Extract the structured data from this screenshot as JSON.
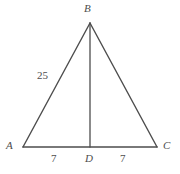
{
  "figure": {
    "stroke_color": "#4d4d4d",
    "background_color": "#ffffff",
    "text_color": "#4d4d4d"
  },
  "vertices": {
    "b": {
      "label": "B",
      "x": 90,
      "y": 23
    },
    "a": {
      "label": "A",
      "x": 23,
      "y": 147
    },
    "c": {
      "label": "C",
      "x": 157,
      "y": 147
    },
    "d": {
      "label": "D",
      "x": 90,
      "y": 147
    }
  },
  "measures": {
    "side_ab": "25",
    "segment_ad": "7",
    "segment_dc": "7"
  },
  "chart_data": {
    "type": "diagram",
    "points": [
      {
        "name": "B",
        "x": 90,
        "y": 23
      },
      {
        "name": "A",
        "x": 23,
        "y": 147
      },
      {
        "name": "C",
        "x": 157,
        "y": 147
      },
      {
        "name": "D",
        "x": 90,
        "y": 147
      }
    ],
    "edges": [
      {
        "from": "A",
        "to": "B",
        "label": "25"
      },
      {
        "from": "B",
        "to": "C",
        "label": ""
      },
      {
        "from": "A",
        "to": "D",
        "label": "7"
      },
      {
        "from": "D",
        "to": "C",
        "label": "7"
      },
      {
        "from": "B",
        "to": "D",
        "label": ""
      }
    ],
    "annotations": [
      "25",
      "7",
      "7"
    ]
  }
}
